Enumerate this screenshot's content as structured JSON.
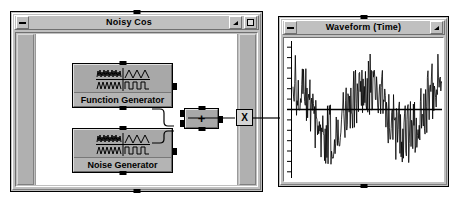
{
  "desktop": {
    "background_color": "#ffffff"
  },
  "diagram_window": {
    "title": "Noisy Cos",
    "minimize_label": "minimize",
    "collapse_label": "collapse",
    "maximize_label": "maximize",
    "blocks": [
      {
        "id": "function-generator",
        "label": "Function Generator",
        "icon": "waveform-grid-icon"
      },
      {
        "id": "noise-generator",
        "label": "Noise Generator",
        "icon": "waveform-grid-icon"
      }
    ],
    "adder": {
      "label": "+",
      "name": "add-operator-block"
    },
    "terminal": {
      "label": "X",
      "name": "output-terminal-x"
    }
  },
  "waveform_window": {
    "title": "Waveform (Time)",
    "minimize_label": "minimize",
    "collapse_label": "collapse"
  },
  "chart_data": {
    "type": "line",
    "title": "Waveform (Time)",
    "xlabel": "",
    "ylabel": "",
    "xlim": [
      0,
      256
    ],
    "ylim": [
      -2.6,
      2.6
    ],
    "grid": false,
    "legend": null,
    "axis_line": 0,
    "y_ticks": [
      -2.4,
      -2.0,
      -1.6,
      -1.2,
      -0.8,
      -0.4,
      0.0,
      0.4,
      0.8,
      1.2,
      1.6,
      2.0,
      2.4
    ],
    "series": [
      {
        "name": "noisy cosine",
        "color": "#000000",
        "description": "cosine of amplitude 1.0 over 2 cycles plus uniform white noise of amplitude ~1.2",
        "signal": {
          "waveform": "cosine",
          "amplitude": 1.0,
          "cycles": 2.0,
          "phase_deg": 0,
          "samples": 256
        },
        "noise": {
          "waveform": "uniform-white-noise",
          "amplitude": 1.2,
          "seed": 20250714
        }
      }
    ]
  },
  "colors": {
    "window_face": "#c0c0c0",
    "block_face": "#a8a8a8",
    "canvas": "#ffffff",
    "trace": "#000000",
    "border": "#000000"
  }
}
